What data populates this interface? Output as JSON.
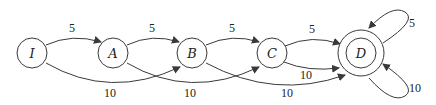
{
  "diagram": {
    "type": "state-transition-graph",
    "nodes": [
      {
        "id": "I",
        "label": "I",
        "accepting": false
      },
      {
        "id": "A",
        "label": "A",
        "accepting": false
      },
      {
        "id": "B",
        "label": "B",
        "accepting": false
      },
      {
        "id": "C",
        "label": "C",
        "accepting": false
      },
      {
        "id": "D",
        "label": "D",
        "accepting": true
      }
    ],
    "edges": [
      {
        "from": "I",
        "to": "A",
        "label": "5"
      },
      {
        "from": "I",
        "to": "B",
        "label": "10"
      },
      {
        "from": "A",
        "to": "B",
        "label": "5"
      },
      {
        "from": "A",
        "to": "C",
        "label": "10"
      },
      {
        "from": "B",
        "to": "C",
        "label": "5"
      },
      {
        "from": "B",
        "to": "D",
        "label": "10"
      },
      {
        "from": "C",
        "to": "D",
        "label": "5"
      },
      {
        "from": "C",
        "to": "D",
        "label": "10"
      },
      {
        "from": "D",
        "to": "D",
        "label": "5"
      },
      {
        "from": "D",
        "to": "D",
        "label": "10"
      }
    ]
  }
}
